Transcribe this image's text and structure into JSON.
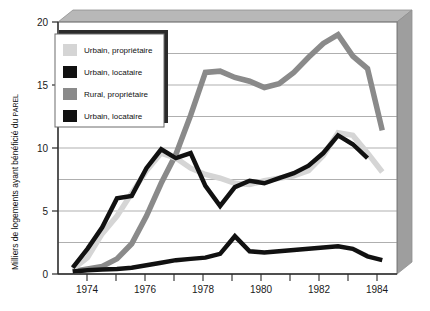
{
  "chart_data": {
    "type": "line",
    "title": "",
    "xlabel": "",
    "ylabel": "Milliers de logements ayant bénéficié du PAREL",
    "ylabel_part_1": "Milliers de logements ayant bénéficié du ",
    "ylabel_part_2": "PAREL",
    "xlim": [
      1973.5,
      1985.0
    ],
    "ylim": [
      0,
      20
    ],
    "grid": true,
    "grid_step": 2.5,
    "legend_position": "top-left-inside",
    "y_ticks": [
      "0",
      "5",
      "10",
      "15",
      "20"
    ],
    "y_tick_values": [
      0,
      5,
      10,
      15,
      20
    ],
    "x_ticks": [
      "1974",
      "1976",
      "1978",
      "1980",
      "1982",
      "1984"
    ],
    "x_tick_values": [
      1974,
      1976,
      1978,
      1980,
      1982,
      1984
    ],
    "x": [
      1974,
      1974.5,
      1975,
      1975.5,
      1976,
      1976.5,
      1977,
      1977.5,
      1978,
      1978.5,
      1979,
      1979.5,
      1980,
      1980.5,
      1981,
      1981.5,
      1982,
      1982.5,
      1983,
      1983.5,
      1984,
      1984.5
    ],
    "series": [
      {
        "name": "Urbain, propriétaire",
        "color": "#d5d5d5",
        "values": [
          0.4,
          1.3,
          3.2,
          4.6,
          6.4,
          8.2,
          9.6,
          9.2,
          8.4,
          7.9,
          7.6,
          7.2,
          7.1,
          7.4,
          7.6,
          7.8,
          8.2,
          9.4,
          11.2,
          11.0,
          9.6,
          8.1
        ]
      },
      {
        "name": "Urbain, locataire",
        "color": "#111111",
        "values": [
          0.5,
          2.0,
          3.7,
          6.0,
          6.2,
          8.4,
          9.9,
          9.2,
          9.6,
          7.0,
          5.4,
          6.9,
          7.4,
          7.2,
          7.6,
          8.0,
          8.6,
          9.6,
          11.0,
          10.3,
          9.2,
          null
        ]
      },
      {
        "name": "Rural, propriétaire",
        "color": "#8a8a8a",
        "values": [
          0.2,
          0.4,
          0.6,
          1.2,
          2.4,
          4.6,
          7.2,
          9.5,
          12.6,
          16.0,
          16.1,
          15.6,
          15.3,
          14.8,
          15.1,
          16.0,
          17.2,
          18.3,
          19.0,
          17.3,
          16.3,
          11.4
        ]
      },
      {
        "name": "Urbain, locataire",
        "color": "#111111",
        "values": [
          0.2,
          0.3,
          0.35,
          0.4,
          0.5,
          0.7,
          0.9,
          1.1,
          1.2,
          1.3,
          1.6,
          3.0,
          1.8,
          1.7,
          1.8,
          1.9,
          2.0,
          2.1,
          2.2,
          2.0,
          1.4,
          1.1
        ]
      }
    ],
    "legend_entries": [
      {
        "label": "Urbain, propriétaire",
        "color": "#d5d5d5"
      },
      {
        "label": "Urbain, locataire",
        "color": "#111111"
      },
      {
        "label": "Rural, propriétaire",
        "color": "#8a8a8a"
      },
      {
        "label": "Urbain, locataire",
        "color": "#111111"
      }
    ],
    "colors": {
      "plot_background": "#ffffff",
      "frame_side": "#9e9e9e",
      "frame_top": "#b5b5b5",
      "gridline": "#8c8c8c",
      "axis": "#2a2a2a",
      "legend_border": "#6d6d6d",
      "legend_shadow": "#2b2b2b"
    }
  }
}
